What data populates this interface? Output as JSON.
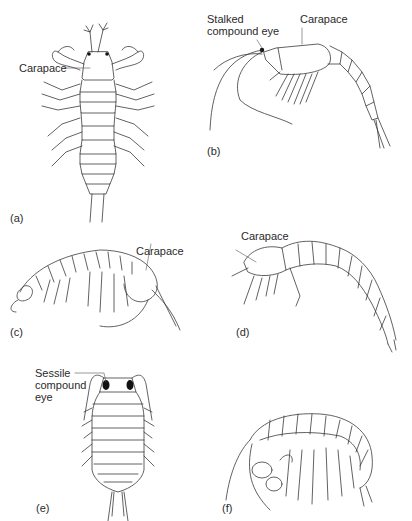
{
  "figure": {
    "panels": [
      {
        "id": "a",
        "label": "(a)",
        "annotations": [
          "Carapace"
        ]
      },
      {
        "id": "b",
        "label": "(b)",
        "annotations": [
          "Stalked compound eye",
          "Carapace"
        ]
      },
      {
        "id": "c",
        "label": "(c)",
        "annotations": [
          "Carapace"
        ]
      },
      {
        "id": "d",
        "label": "(d)",
        "annotations": [
          "Carapace"
        ]
      },
      {
        "id": "e",
        "label": "(e)",
        "annotations": [
          "Sessile compound eye"
        ]
      },
      {
        "id": "f",
        "label": "(f)",
        "annotations": []
      }
    ],
    "text": {
      "a_carapace": "Carapace",
      "b_eye": "Stalked\ncompound eye",
      "b_carapace": "Carapace",
      "c_carapace": "Carapace",
      "d_carapace": "Carapace",
      "e_eye": "Sessile\ncompound\neye",
      "label_a": "(a)",
      "label_b": "(b)",
      "label_c": "(c)",
      "label_d": "(d)",
      "label_e": "(e)",
      "label_f": "(f)"
    },
    "colors": {
      "line": "#3a3a3a",
      "eye": "#111111",
      "background": "#ffffff"
    }
  }
}
